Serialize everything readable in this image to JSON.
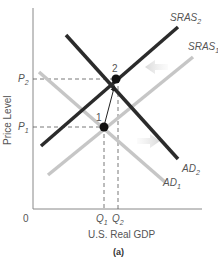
{
  "diagram": {
    "panel_label": "(a)",
    "y_axis_label": "Price Level",
    "x_axis_label": "U.S. Real GDP",
    "origin_label": "0",
    "price_ticks": [
      {
        "name": "P",
        "sub": "2"
      },
      {
        "name": "P",
        "sub": "1"
      }
    ],
    "quantity_ticks": [
      {
        "name": "Q",
        "sub": "1"
      },
      {
        "name": "Q",
        "sub": "2"
      }
    ],
    "curves": [
      {
        "name": "SRAS",
        "sub": "2",
        "color": "#2b2b2b"
      },
      {
        "name": "SRAS",
        "sub": "1",
        "color": "#c6c6c6"
      },
      {
        "name": "AD",
        "sub": "2",
        "color": "#2b2b2b"
      },
      {
        "name": "AD",
        "sub": "1",
        "color": "#c6c6c6"
      }
    ],
    "points": [
      {
        "label": "1"
      },
      {
        "label": "2"
      }
    ],
    "shift_arrows": [
      {
        "direction": "left",
        "meaning": "SRAS shifts left"
      },
      {
        "direction": "right",
        "meaning": "AD shifts right"
      }
    ]
  }
}
